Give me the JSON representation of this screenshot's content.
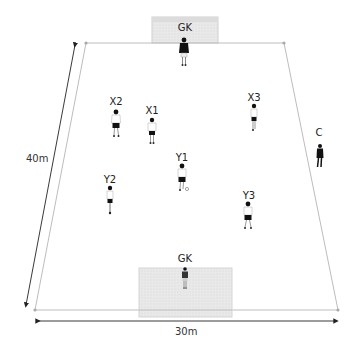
{
  "diagram": {
    "colors": {
      "field_line": "#bdbdbd",
      "goal_fill": "#e6e6e6",
      "arrow": "#222222",
      "player_dark": "#111111",
      "player_light": "#ffffff"
    },
    "dimensions": {
      "width_label": "30m",
      "length_label": "40m"
    },
    "goals": [
      {
        "id": "top-goal",
        "label": "GK"
      },
      {
        "id": "bottom-goal",
        "label": "GK"
      }
    ],
    "players": [
      {
        "id": "gk-top",
        "label": "GK",
        "team": "goalkeeper",
        "x": 184,
        "y": 48
      },
      {
        "id": "x1",
        "label": "X1",
        "team": "X",
        "x": 152,
        "y": 118
      },
      {
        "id": "x2",
        "label": "X2",
        "team": "X",
        "x": 116,
        "y": 110
      },
      {
        "id": "x3",
        "label": "X3",
        "team": "X",
        "x": 254,
        "y": 104
      },
      {
        "id": "y1",
        "label": "Y1",
        "team": "Y",
        "x": 182,
        "y": 164
      },
      {
        "id": "y2",
        "label": "Y2",
        "team": "Y",
        "x": 110,
        "y": 186
      },
      {
        "id": "y3",
        "label": "Y3",
        "team": "Y",
        "x": 248,
        "y": 202
      },
      {
        "id": "gk-bottom",
        "label": "GK",
        "team": "goalkeeper",
        "x": 185,
        "y": 267
      },
      {
        "id": "coach",
        "label": "C",
        "team": "coach",
        "x": 318,
        "y": 145
      }
    ],
    "ball": {
      "x": 187,
      "y": 189
    }
  }
}
